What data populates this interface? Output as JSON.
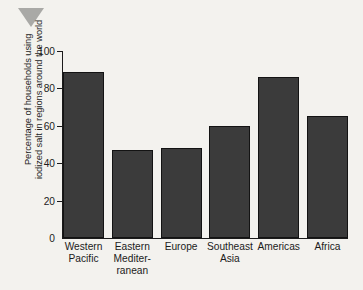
{
  "marker": {
    "icon": "triangle-down-icon",
    "color": "#a9a9a6"
  },
  "chart_data": {
    "type": "bar",
    "title": "",
    "xlabel": "",
    "ylabel": "Percentage of households using iodized salt in regions around the world",
    "ylabel_lines": [
      "Percentage of households using",
      "iodized salt in regions around the world"
    ],
    "categories": [
      "Western Pacific",
      "Eastern Mediterranean",
      "Europe",
      "Southeast Asia",
      "Americas",
      "Africa"
    ],
    "category_lines": [
      [
        "Western",
        "Pacific"
      ],
      [
        "Eastern",
        "Mediter-",
        "ranean"
      ],
      [
        "Europe"
      ],
      [
        "Southeast",
        "Asia"
      ],
      [
        "Americas"
      ],
      [
        "Africa"
      ]
    ],
    "values": [
      89,
      47,
      48,
      60,
      86,
      65
    ],
    "ylim": [
      0,
      100
    ],
    "yticks": [
      100,
      80,
      60,
      40,
      20,
      0
    ],
    "ytick_labels": [
      "100",
      "80",
      "60",
      "40",
      "20",
      "0"
    ],
    "grid": false,
    "legend": false,
    "bar_color": "#3b3b3b",
    "bar_edge_color": "#131313",
    "axis_color": "#1b1b1b",
    "background_color": "#f3f2ee"
  }
}
